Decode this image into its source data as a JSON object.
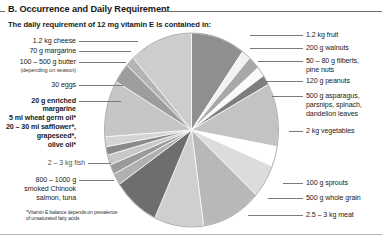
{
  "header": {
    "section_label": "B. Occurrence and Daily Requirement",
    "subtitle": "The daily requirement of 12 mg vitamin E is contained in:"
  },
  "footnote": {
    "line1": "*Vitamin E balance depends on prevalence",
    "line2": "of unsaturated fatty acids"
  },
  "labels_left": [
    {
      "id": "cheese",
      "text": "1.2 kg cheese"
    },
    {
      "id": "margarine",
      "text": "70 g margarine"
    },
    {
      "id": "butter",
      "text": "100 – 500 g butter"
    },
    {
      "id": "butter-note",
      "text": "(depending on season)"
    },
    {
      "id": "eggs",
      "text": "30 eggs"
    },
    {
      "id": "enriched-margarine-1",
      "text": "20 g enriched"
    },
    {
      "id": "enriched-margarine-2",
      "text": "margarine"
    },
    {
      "id": "wheat-germ-oil",
      "text": "5 ml wheat germ oil*"
    },
    {
      "id": "safflower-oil",
      "text": "20 – 30 ml safflower*,"
    },
    {
      "id": "grapeseed-oil",
      "text": "grapeseed*,"
    },
    {
      "id": "olive-oil",
      "text": "olive oil*"
    },
    {
      "id": "fish",
      "text": "2 – 3 kg fish"
    },
    {
      "id": "salmon-1",
      "text": "800 – 1000 g"
    },
    {
      "id": "salmon-2",
      "text": "smoked Chinook"
    },
    {
      "id": "salmon-3",
      "text": "salmon, tuna"
    }
  ],
  "labels_right": [
    {
      "id": "fruit",
      "text": "1.2 kg fruit"
    },
    {
      "id": "walnuts",
      "text": "200 g walnuts"
    },
    {
      "id": "filberts-1",
      "text": "50 – 80 g filberts,"
    },
    {
      "id": "filberts-2",
      "text": "pine nuts"
    },
    {
      "id": "peanuts",
      "text": "120 g peanuts"
    },
    {
      "id": "asparagus-1",
      "text": "500 g asparagus,"
    },
    {
      "id": "asparagus-2",
      "text": "parsnips, spinach,"
    },
    {
      "id": "asparagus-3",
      "text": "dandelion leaves"
    },
    {
      "id": "vegetables",
      "text": "2 kg vegetables"
    },
    {
      "id": "sprouts",
      "text": "100 g sprouts"
    },
    {
      "id": "whole-grain",
      "text": "500 g whole grain"
    },
    {
      "id": "meat",
      "text": "2.5 – 3 kg meat"
    }
  ],
  "chart_data": {
    "type": "pie",
    "title": "The daily requirement of 12 mg vitamin E is contained in:",
    "legend": "external leader-line labels",
    "note": "Angles are approximate readings from the rendered ellipse; slices proceed clockwise from 12 o'clock.",
    "slices": [
      {
        "label": "1.2 kg fruit",
        "start_deg": 0,
        "end_deg": 36,
        "color": "#8f8f8f"
      },
      {
        "label": "200 g walnuts",
        "start_deg": 36,
        "end_deg": 42,
        "color": "#f2f2f2"
      },
      {
        "label": "50 – 80 g filberts, pine nuts",
        "start_deg": 42,
        "end_deg": 50,
        "color": "#a8a8a8"
      },
      {
        "label": "120 g peanuts",
        "start_deg": 50,
        "end_deg": 56,
        "color": "#fafafa"
      },
      {
        "label": "500 g asparagus, parsnips, spinach, dandelion leaves",
        "start_deg": 56,
        "end_deg": 62,
        "color": "#7d7d7d"
      },
      {
        "label": "2 kg vegetables",
        "start_deg": 62,
        "end_deg": 100,
        "color": "#c3c3c3"
      },
      {
        "label": "100 g sprouts",
        "start_deg": 100,
        "end_deg": 112,
        "color": "#ffffff"
      },
      {
        "label": "500 g whole grain",
        "start_deg": 112,
        "end_deg": 132,
        "color": "#dcdcdc"
      },
      {
        "label": "2.5 – 3 kg meat",
        "start_deg": 132,
        "end_deg": 172,
        "color": "#b8b8b8"
      },
      {
        "label": "800 – 1000 g smoked Chinook salmon, tuna",
        "start_deg": 172,
        "end_deg": 205,
        "color": "#cfcfcf"
      },
      {
        "label": "2 – 3 kg fish",
        "start_deg": 205,
        "end_deg": 236,
        "color": "#6e6e6e"
      },
      {
        "label": "olive oil*",
        "start_deg": 236,
        "end_deg": 243,
        "color": "#b0b0b0"
      },
      {
        "label": "grapeseed*",
        "start_deg": 243,
        "end_deg": 249,
        "color": "#9a9a9a"
      },
      {
        "label": "20 – 30 ml safflower*",
        "start_deg": 249,
        "end_deg": 255,
        "color": "#c8c8c8"
      },
      {
        "label": "5 ml wheat germ oil*",
        "start_deg": 255,
        "end_deg": 260,
        "color": "#8a8a8a"
      },
      {
        "label": "20 g enriched margarine",
        "start_deg": 260,
        "end_deg": 266,
        "color": "#d4d4d4"
      },
      {
        "label": "30 eggs",
        "start_deg": 266,
        "end_deg": 300,
        "color": "#c6c6c6"
      },
      {
        "label": "100 – 500 g butter",
        "start_deg": 300,
        "end_deg": 312,
        "color": "#9d9d9d"
      },
      {
        "label": "70 g margarine",
        "start_deg": 312,
        "end_deg": 318,
        "color": "#b4b4b4"
      },
      {
        "label": "1.2 kg cheese",
        "start_deg": 318,
        "end_deg": 360,
        "color": "#cdcdcd"
      }
    ]
  }
}
